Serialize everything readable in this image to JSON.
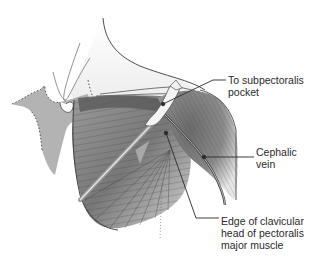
{
  "figure": {
    "labels": [
      {
        "id": "subpectoralis-pocket",
        "text": "To  subpectoralis\npocket"
      },
      {
        "id": "cephalic-vein",
        "text": "Cephalic\nvein"
      },
      {
        "id": "clavicular-head-edge",
        "text": "Edge of clavicular\nhead of pectoralis\nmajor muscle"
      }
    ],
    "colors": {
      "line": "#2a2a2a",
      "muscle_dark": "#5a5a5a",
      "muscle_mid": "#8c8c8c",
      "muscle_light": "#c8c8c8",
      "skin_shade": "#d9d9d9",
      "background": "#ffffff"
    }
  }
}
